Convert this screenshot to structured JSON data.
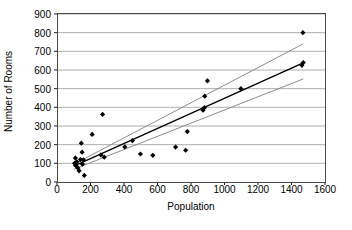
{
  "chart_data": {
    "type": "scatter",
    "title": "",
    "xlabel": "Population",
    "ylabel": "Number of Rooms",
    "xlim": [
      0,
      1600
    ],
    "ylim": [
      0,
      900
    ],
    "xticks": [
      0,
      200,
      400,
      600,
      800,
      1000,
      1200,
      1400,
      1600
    ],
    "yticks": [
      0,
      100,
      200,
      300,
      400,
      500,
      600,
      700,
      800,
      900
    ],
    "grid": "horizontal",
    "legend": "none",
    "marker": "diamond",
    "marker_color": "#000000",
    "points": [
      {
        "x": 105,
        "y": 100
      },
      {
        "x": 110,
        "y": 128
      },
      {
        "x": 112,
        "y": 88
      },
      {
        "x": 118,
        "y": 108
      },
      {
        "x": 125,
        "y": 75
      },
      {
        "x": 132,
        "y": 60
      },
      {
        "x": 140,
        "y": 120
      },
      {
        "x": 145,
        "y": 208
      },
      {
        "x": 150,
        "y": 160
      },
      {
        "x": 152,
        "y": 95
      },
      {
        "x": 158,
        "y": 118
      },
      {
        "x": 163,
        "y": 35
      },
      {
        "x": 210,
        "y": 255
      },
      {
        "x": 262,
        "y": 145
      },
      {
        "x": 272,
        "y": 362
      },
      {
        "x": 282,
        "y": 133
      },
      {
        "x": 405,
        "y": 188
      },
      {
        "x": 450,
        "y": 222
      },
      {
        "x": 498,
        "y": 150
      },
      {
        "x": 572,
        "y": 143
      },
      {
        "x": 708,
        "y": 187
      },
      {
        "x": 768,
        "y": 170
      },
      {
        "x": 778,
        "y": 270
      },
      {
        "x": 872,
        "y": 385
      },
      {
        "x": 880,
        "y": 398
      },
      {
        "x": 882,
        "y": 460
      },
      {
        "x": 898,
        "y": 542
      },
      {
        "x": 1098,
        "y": 500
      },
      {
        "x": 1462,
        "y": 625
      },
      {
        "x": 1468,
        "y": 800
      },
      {
        "x": 1470,
        "y": 640
      }
    ],
    "lines": [
      {
        "name": "regression-fit",
        "color": "#000000",
        "width": 1.4,
        "points": [
          [
            100,
            85
          ],
          [
            1470,
            638
          ]
        ]
      },
      {
        "name": "upper-confidence-band",
        "color": "#8c8c8c",
        "width": 1.0,
        "points": [
          [
            100,
            95
          ],
          [
            1470,
            740
          ]
        ]
      },
      {
        "name": "lower-confidence-band",
        "color": "#8c8c8c",
        "width": 1.0,
        "points": [
          [
            100,
            68
          ],
          [
            1470,
            552
          ]
        ]
      }
    ]
  },
  "axes": {
    "y_title": "Number of Rooms",
    "x_title": "Population",
    "y_tick_labels": [
      "900",
      "800",
      "700",
      "600",
      "500",
      "400",
      "300",
      "200",
      "100",
      "0"
    ],
    "x_tick_labels": [
      "0",
      "200",
      "400",
      "600",
      "800",
      "1000",
      "1200",
      "1400",
      "1600"
    ]
  },
  "colors": {
    "gridline": "#9a9a9a",
    "frame": "#4a4a4a",
    "marker": "#000000",
    "fit_line": "#000000",
    "band_line": "#8c8c8c",
    "background": "#ffffff",
    "text": "#000000"
  }
}
